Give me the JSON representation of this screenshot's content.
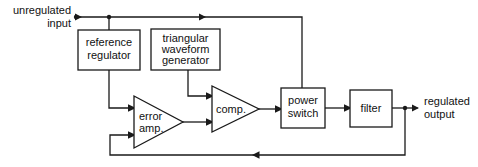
{
  "diagram": {
    "colors": {
      "line": "#1a1a1a",
      "text": "#111111",
      "background": "#ffffff"
    },
    "io_labels": {
      "input_line1": "unregulated",
      "input_line2": "input",
      "output_line1": "regulated",
      "output_line2": "output"
    },
    "blocks": [
      {
        "id": "reference-regulator",
        "shape": "rect",
        "line1": "reference",
        "line2": "regulator"
      },
      {
        "id": "triangular-waveform-generator",
        "shape": "rect",
        "line1": "triangular",
        "line2": "waveform",
        "line3": "generator"
      },
      {
        "id": "error-amp",
        "shape": "triangle",
        "line1": "error",
        "line2": "amp."
      },
      {
        "id": "comparator",
        "shape": "triangle",
        "line1": "comp."
      },
      {
        "id": "power-switch",
        "shape": "rect",
        "line1": "power",
        "line2": "switch"
      },
      {
        "id": "filter",
        "shape": "rect",
        "line1": "filter"
      }
    ]
  }
}
